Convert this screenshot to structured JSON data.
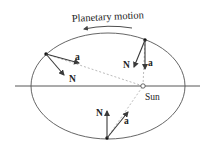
{
  "title": "Planetary motion",
  "labels": {
    "sun": "Sun",
    "acceleration": "a",
    "normal": "N"
  },
  "colors": {
    "stroke": "#3a3a3a",
    "orbit": "#555555",
    "dashed": "#aaaaaa",
    "background": "#ffffff"
  },
  "planets": [
    {
      "position": "upper-left",
      "a_label": "a",
      "n_label": "N"
    },
    {
      "position": "upper-right",
      "a_label": "a",
      "n_label": "N"
    },
    {
      "position": "bottom",
      "a_label": "a",
      "n_label": "N"
    }
  ]
}
